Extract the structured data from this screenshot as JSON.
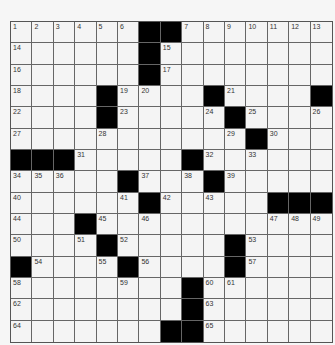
{
  "puzzle": {
    "rows": 15,
    "cols": 15,
    "colors": {
      "background": "#f4f4f4",
      "block": "#000000",
      "line": "#666666",
      "number": "#333333"
    },
    "grid": [
      [
        "1",
        "2",
        "3",
        "4",
        "5",
        "6",
        "#",
        "#",
        "7",
        "8",
        "9",
        "10",
        "11",
        "12",
        "13"
      ],
      [
        "14",
        ".",
        ".",
        ".",
        ".",
        ".",
        "#",
        "15",
        ".",
        ".",
        ".",
        ".",
        ".",
        ".",
        "."
      ],
      [
        "16",
        ".",
        ".",
        ".",
        ".",
        ".",
        "#",
        "17",
        ".",
        ".",
        ".",
        ".",
        ".",
        ".",
        "."
      ],
      [
        "18",
        ".",
        ".",
        ".",
        "#",
        "19",
        "20",
        ".",
        ".",
        "#",
        "21",
        ".",
        ".",
        ".",
        "#"
      ],
      [
        "22",
        ".",
        ".",
        ".",
        "#",
        "23",
        ".",
        ".",
        ".",
        "24",
        "#",
        "25",
        ".",
        ".",
        "26"
      ],
      [
        "27",
        ".",
        ".",
        ".",
        "28",
        ".",
        ".",
        ".",
        ".",
        ".",
        "29",
        "#",
        "30",
        ".",
        "."
      ],
      [
        "#",
        "#",
        "#",
        "31",
        ".",
        ".",
        ".",
        ".",
        "#",
        "32",
        ".",
        "33",
        ".",
        ".",
        "."
      ],
      [
        "34",
        "35",
        "36",
        ".",
        ".",
        "#",
        "37",
        ".",
        "38",
        "#",
        "39",
        ".",
        ".",
        ".",
        "."
      ],
      [
        "40",
        ".",
        ".",
        ".",
        ".",
        "41",
        "#",
        "42",
        ".",
        "43",
        ".",
        ".",
        "#",
        "#",
        "#"
      ],
      [
        "44",
        ".",
        ".",
        "#",
        "45",
        ".",
        "46",
        ".",
        ".",
        ".",
        ".",
        ".",
        "47",
        "48",
        "49"
      ],
      [
        "50",
        ".",
        ".",
        "51",
        "#",
        "52",
        ".",
        ".",
        ".",
        ".",
        "#",
        "53",
        ".",
        ".",
        "."
      ],
      [
        "#",
        "54",
        ".",
        ".",
        "55",
        "#",
        "56",
        ".",
        ".",
        ".",
        "#",
        "57",
        ".",
        ".",
        "."
      ],
      [
        "58",
        ".",
        ".",
        ".",
        ".",
        "59",
        ".",
        ".",
        "#",
        "60",
        "61",
        ".",
        ".",
        ".",
        "."
      ],
      [
        "62",
        ".",
        ".",
        ".",
        ".",
        ".",
        ".",
        ".",
        "#",
        "63",
        ".",
        ".",
        ".",
        ".",
        "."
      ],
      [
        "64",
        ".",
        ".",
        ".",
        ".",
        ".",
        ".",
        "#",
        "#",
        "65",
        ".",
        ".",
        ".",
        ".",
        "."
      ]
    ]
  }
}
